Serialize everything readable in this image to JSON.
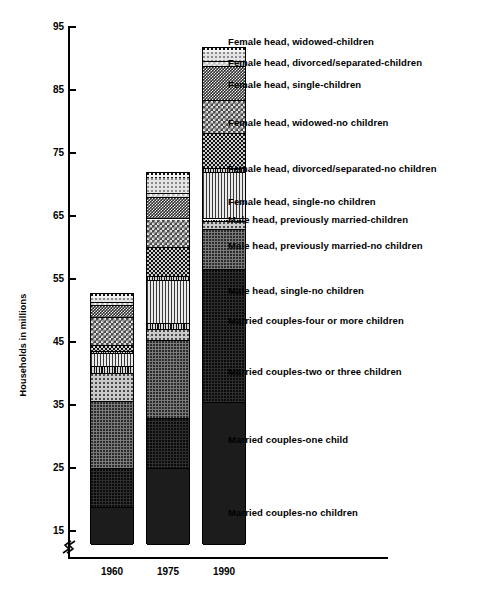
{
  "chart_data": {
    "type": "bar",
    "subtype": "stacked-bar",
    "title": "",
    "xlabel": "",
    "ylabel": "Households in millions",
    "categories": [
      "1960",
      "1975",
      "1990"
    ],
    "ylim": [
      13,
      95
    ],
    "yticks": [
      15,
      25,
      35,
      45,
      55,
      65,
      75,
      85,
      95
    ],
    "ytick_labels": [
      "15",
      "25",
      "35",
      "45",
      "55",
      "65",
      "75",
      "85",
      "95"
    ],
    "axis_break": true,
    "grid": false,
    "legend_position": "right-inline",
    "totals": [
      52.8,
      72.0,
      91.9
    ],
    "series": [
      {
        "name": "Married couples-no children",
        "pattern": "p-solid-dark",
        "values": [
          18.8,
          25.0,
          35.4
        ]
      },
      {
        "name": "Married couples-one child",
        "pattern": "p-dark-dot",
        "values": [
          25.0,
          33.0,
          56.6
        ]
      },
      {
        "name": "Married couples-two or three children",
        "pattern": "p-mid-dot",
        "values": [
          35.6,
          45.3,
          63.0
        ]
      },
      {
        "name": "Married couples-four or more children",
        "pattern": "p-light-dot",
        "values": [
          40.0,
          47.0,
          64.2
        ]
      },
      {
        "name": "Male head, single-no children",
        "pattern": "p-vstripe-dark",
        "values": [
          41.2,
          48.0,
          64.6
        ]
      },
      {
        "name": "Male head, previously married-no children",
        "pattern": "p-vstripe-light",
        "values": [
          43.2,
          54.8,
          72.0
        ]
      },
      {
        "name": "Male head, previously married-children",
        "pattern": "p-hatch",
        "values": [
          43.6,
          55.4,
          72.6
        ]
      },
      {
        "name": "Female head, single-no children",
        "pattern": "p-check-dark",
        "values": [
          44.6,
          60.0,
          78.2
        ]
      },
      {
        "name": "Female head, divorced/separated-no children",
        "pattern": "p-check-mid",
        "values": [
          49.0,
          64.6,
          83.4
        ]
      },
      {
        "name": "Female head, widowed-no children",
        "pattern": "p-check-tiny",
        "values": [
          50.8,
          68.0,
          88.8
        ]
      },
      {
        "name": "Female head, single-children",
        "pattern": "p-check-light",
        "values": [
          51.4,
          68.6,
          89.6
        ]
      },
      {
        "name": "Female head, divorced/separated-children",
        "pattern": "p-pale",
        "values": [
          52.2,
          71.2,
          91.2
        ]
      },
      {
        "name": "Female head, widowed-children",
        "pattern": "p-white-dot",
        "values": [
          52.8,
          72.0,
          91.9
        ]
      }
    ],
    "legend_entries": [
      {
        "label": "Female head, widowed-children",
        "top": 36
      },
      {
        "label": "Female head, divorced/separated-children",
        "top": 57
      },
      {
        "label": "Female head, single-children",
        "top": 79
      },
      {
        "label": "Female head, widowed-no children",
        "top": 117
      },
      {
        "label": "Female head, divorced/separated-no children",
        "top": 163
      },
      {
        "label": "Female head, single-no children",
        "top": 196
      },
      {
        "label": "Male head, previously married-children",
        "top": 214
      },
      {
        "label": "Male head, previously married-no children",
        "top": 240
      },
      {
        "label": "Male head, single-no children",
        "top": 285
      },
      {
        "label": "Married couples-four or more children",
        "top": 315
      },
      {
        "label": "Married couples-two or three children",
        "top": 366
      },
      {
        "label": "Married couples-one child",
        "top": 434
      },
      {
        "label": "Married couples-no children",
        "top": 507
      }
    ]
  }
}
